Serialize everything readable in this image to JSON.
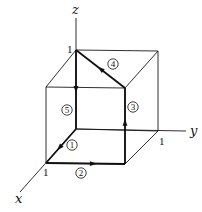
{
  "diagram": {
    "type": "unit-cube-path",
    "axes": [
      {
        "id": "x",
        "label": "x",
        "from": [
          76,
          129
        ],
        "to": [
          20,
          192
        ],
        "label_pos": [
          15,
          203
        ]
      },
      {
        "id": "y",
        "label": "y",
        "from": [
          76,
          129
        ],
        "to": [
          186,
          131
        ],
        "label_pos": [
          190,
          135
        ]
      },
      {
        "id": "z",
        "label": "z",
        "from": [
          76,
          129
        ],
        "to": [
          76,
          18
        ],
        "label_pos": [
          72,
          14
        ]
      }
    ],
    "tick_labels": [
      {
        "text": "1",
        "axis": "x",
        "pos": [
          43,
          176
        ]
      },
      {
        "text": "1",
        "axis": "y",
        "pos": [
          159,
          145
        ]
      },
      {
        "text": "1",
        "axis": "z",
        "pos": [
          67,
          53
        ]
      }
    ],
    "vertices": {
      "O": [
        76,
        129
      ],
      "X": [
        46,
        163
      ],
      "Y": [
        158,
        131
      ],
      "Z": [
        76,
        50
      ],
      "XY": [
        125,
        164
      ],
      "XZ": [
        46,
        87
      ],
      "YZ": [
        158,
        51
      ],
      "XYZ": [
        125,
        88
      ]
    },
    "cube_edges": [
      [
        "X",
        "XY"
      ],
      [
        "XY",
        "Y"
      ],
      [
        "Y",
        "O"
      ],
      [
        "X",
        "XZ"
      ],
      [
        "XY",
        "XYZ"
      ],
      [
        "Y",
        "YZ"
      ],
      [
        "XZ",
        "XYZ"
      ],
      [
        "XYZ",
        "YZ"
      ],
      [
        "YZ",
        "Z"
      ],
      [
        "Z",
        "XZ"
      ]
    ],
    "path_steps": [
      {
        "step": "1",
        "from": "O",
        "to": "X",
        "label_pos": [
          72,
          145
        ],
        "arrow_t": 0.55
      },
      {
        "step": "2",
        "from": "X",
        "to": "XY",
        "label_pos": [
          81,
          173
        ],
        "arrow_t": 0.6
      },
      {
        "step": "3",
        "from": "XY",
        "to": "XYZ",
        "label_pos": [
          133,
          107
        ],
        "arrow_t": 0.55
      },
      {
        "step": "4",
        "from": "XYZ",
        "to": "Z",
        "label_pos": [
          113,
          64
        ],
        "arrow_t": 0.5
      },
      {
        "step": "5",
        "from": "Z",
        "to": "O",
        "label_pos": [
          67,
          110
        ],
        "arrow_t": 0.5
      }
    ],
    "colors": {
      "line": "#111111",
      "background": "#ffffff"
    }
  }
}
